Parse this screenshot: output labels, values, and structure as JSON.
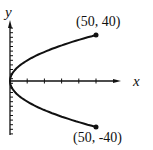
{
  "chart_data": {
    "type": "line",
    "title": "",
    "xlabel": "x",
    "ylabel": "y",
    "series": [
      {
        "name": "curve",
        "x": [
          50,
          32,
          18,
          8,
          2,
          0,
          2,
          8,
          18,
          32,
          50
        ],
        "y": [
          -40,
          -32,
          -24,
          -16,
          -8,
          0,
          8,
          16,
          24,
          32,
          40
        ]
      }
    ],
    "annotations": [
      {
        "label": "(50, 40)",
        "x": 50,
        "y": 40
      },
      {
        "label": "(50, -40)",
        "x": 50,
        "y": -40
      }
    ],
    "xlim": [
      0,
      60
    ],
    "ylim": [
      -50,
      50
    ],
    "x_tick_step": 10,
    "y_tick_step": 4
  },
  "labels": {
    "top_point": "(50, 40)",
    "bottom_point": "(50, -40)",
    "x_axis": "x",
    "y_axis": "y"
  }
}
